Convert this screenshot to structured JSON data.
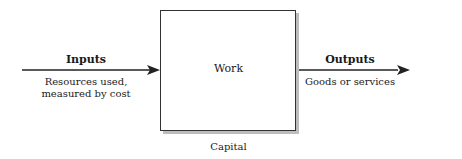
{
  "diagram": {
    "process_box": {
      "label": "Work"
    },
    "below_box": {
      "label": "Capital"
    },
    "input": {
      "title": "Inputs",
      "description_line1": "Resources used,",
      "description_line2": "measured by cost"
    },
    "output": {
      "title": "Outputs",
      "description": "Goods or services"
    },
    "colors": {
      "line": "#222222",
      "box_border": "#333333",
      "shadow": "#bdbdbd"
    }
  }
}
